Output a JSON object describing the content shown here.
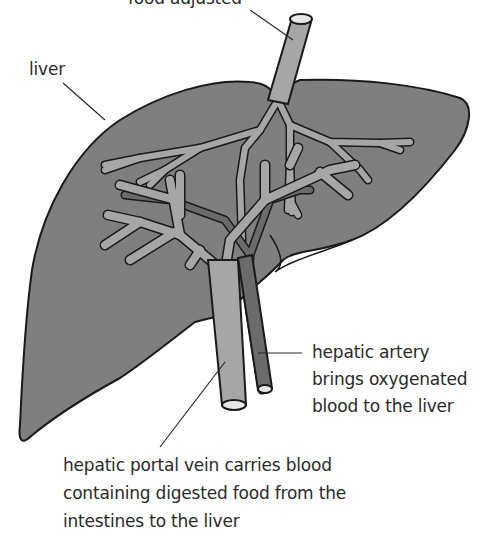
{
  "diagram": {
    "colors": {
      "liver_fill": "#7f7f7f",
      "outline": "#1a1a1a",
      "portal_vein": "#a6a6a6",
      "hepatic_artery": "#6b6b6b",
      "bile_duct": "#a6a6a6",
      "lumen": "#e8e8e8",
      "text": "#2a2a2a"
    },
    "labels": {
      "top": {
        "lines": [
          "food adjusted"
        ]
      },
      "liver": {
        "lines": [
          "liver"
        ]
      },
      "hepatic_artery": {
        "lines": [
          "hepatic artery",
          "brings oxygenated",
          "blood to the liver"
        ]
      },
      "portal_vein": {
        "lines": [
          "hepatic portal vein carries blood",
          "containing digested food from the",
          "intestines to the liver"
        ]
      }
    }
  }
}
